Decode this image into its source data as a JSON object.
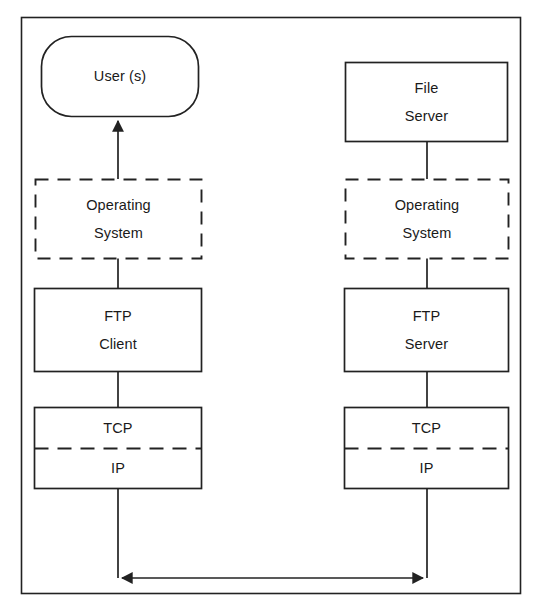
{
  "diagram": {
    "type": "block-diagram",
    "stroke_color": "#222222",
    "background_color": "#ffffff",
    "frame": {
      "x": 21,
      "y": 17,
      "width": 499,
      "height": 576
    },
    "columns": {
      "client": {
        "center_x": 118,
        "box_left": 34,
        "box_right": 201
      },
      "server": {
        "center_x": 427,
        "box_left": 344,
        "box_right": 508
      }
    },
    "nodes": [
      {
        "id": "users",
        "name": "users-node",
        "shape": "rounded-rect",
        "border": "solid",
        "lines": [
          "User (s)"
        ],
        "x": 41,
        "y": 36,
        "width": 157,
        "height": 80,
        "radius": 30
      },
      {
        "id": "file-server",
        "name": "file-server-node",
        "shape": "rect",
        "border": "solid",
        "lines": [
          "File",
          "Server"
        ],
        "x": 345,
        "y": 62,
        "width": 162,
        "height": 79
      },
      {
        "id": "os-client",
        "name": "operating-system-client-node",
        "shape": "rect",
        "border": "dashed",
        "lines": [
          "Operating",
          "System"
        ],
        "x": 35,
        "y": 179,
        "width": 166,
        "height": 79
      },
      {
        "id": "os-server",
        "name": "operating-system-server-node",
        "shape": "rect",
        "border": "dashed",
        "lines": [
          "Operating",
          "System"
        ],
        "x": 345,
        "y": 179,
        "width": 163,
        "height": 79
      },
      {
        "id": "ftp-client",
        "name": "ftp-client-node",
        "shape": "rect",
        "border": "solid",
        "lines": [
          "FTP",
          "Client"
        ],
        "x": 34,
        "y": 288,
        "width": 167,
        "height": 83
      },
      {
        "id": "ftp-server",
        "name": "ftp-server-node",
        "shape": "rect",
        "border": "solid",
        "lines": [
          "FTP",
          "Server"
        ],
        "x": 344,
        "y": 288,
        "width": 164,
        "height": 83
      },
      {
        "id": "tcpip-client",
        "name": "tcp-ip-client-node",
        "shape": "split-rect",
        "border": "solid",
        "divider": "dashed",
        "lines": [
          "TCP",
          "IP"
        ],
        "x": 34,
        "y": 407,
        "width": 167,
        "height": 81,
        "divider_y": 448
      },
      {
        "id": "tcpip-server",
        "name": "tcp-ip-server-node",
        "shape": "split-rect",
        "border": "solid",
        "divider": "dashed",
        "lines": [
          "TCP",
          "IP"
        ],
        "x": 344,
        "y": 407,
        "width": 164,
        "height": 81,
        "divider_y": 448
      }
    ],
    "connectors": [
      {
        "id": "users-arrow",
        "name": "connector-os-to-users",
        "from": "os-client",
        "to": "users",
        "arrow": "end",
        "path": "M 118 179 L 118 117"
      },
      {
        "id": "client-os-ftp",
        "name": "connector-os-to-ftp-client",
        "from": "os-client",
        "to": "ftp-client",
        "arrow": "none",
        "path": "M 118 258 L 118 288"
      },
      {
        "id": "client-ftp-tcp",
        "name": "connector-ftp-client-to-tcp",
        "from": "ftp-client",
        "to": "tcpip-client",
        "arrow": "none",
        "path": "M 118 371 L 118 407"
      },
      {
        "id": "server-file-os",
        "name": "connector-file-server-to-os",
        "from": "file-server",
        "to": "os-server",
        "arrow": "none",
        "path": "M 427 141 L 427 179"
      },
      {
        "id": "server-os-ftp",
        "name": "connector-os-to-ftp-server",
        "from": "os-server",
        "to": "ftp-server",
        "arrow": "none",
        "path": "M 427 258 L 427 288"
      },
      {
        "id": "server-ftp-tcp",
        "name": "connector-ftp-server-to-tcp",
        "from": "ftp-server",
        "to": "tcpip-server",
        "arrow": "none",
        "path": "M 427 371 L 427 407"
      },
      {
        "id": "network-link",
        "name": "connector-network-link",
        "from": "tcpip-client",
        "to": "tcpip-server",
        "arrow": "both",
        "path": "M 118 488 L 118 578 L 427 578 L 427 488"
      }
    ]
  }
}
